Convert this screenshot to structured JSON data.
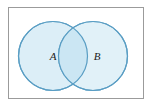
{
  "figure": {
    "kind": "venn-diagram",
    "background_color": "#ffffff",
    "frame": {
      "border_color": "#9b9b9b",
      "fill_color": "#ffffff",
      "x": 8,
      "y": 7,
      "width": 136,
      "height": 92
    },
    "circle_style": {
      "fill_color": "#dceef7",
      "stroke_color": "#5a9ec4",
      "stroke_width": 1.2,
      "overlap_fill_color": "#cbe6f3"
    },
    "sets": [
      {
        "label": "A",
        "name": "set-a",
        "cx": 53,
        "cy": 56,
        "r": 34.5,
        "label_x": 53,
        "label_y": 56
      },
      {
        "label": "B",
        "name": "set-b",
        "cx": 93,
        "cy": 56,
        "r": 34.5,
        "label_x": 97,
        "label_y": 56
      }
    ],
    "intersection": {
      "name": "intersection-region",
      "label": ""
    }
  }
}
